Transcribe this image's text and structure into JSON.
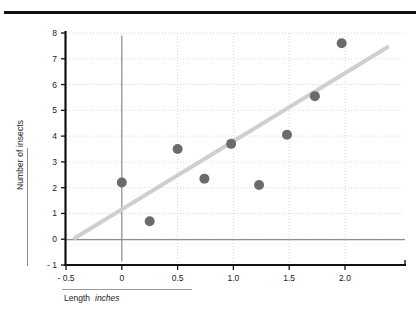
{
  "page": {
    "background": "#ffffff",
    "top_rule_color": "#111111"
  },
  "axis_titles": {
    "y": "Number of insects",
    "x_name": "Length",
    "x_unit": "inches"
  },
  "chart_data": {
    "type": "scatter",
    "title": "",
    "xlabel": "Length  inches",
    "ylabel": "Number of insects",
    "xlim": [
      -0.5,
      2.4
    ],
    "ylim": [
      -1,
      8
    ],
    "xticks": [
      -0.5,
      0,
      0.5,
      1.0,
      1.5,
      2.0
    ],
    "xticklabels": [
      "- 0.5",
      "0",
      "0.5",
      "1.0",
      "1.5",
      "2.0"
    ],
    "yticks": [
      -1,
      0,
      1,
      2,
      3,
      4,
      5,
      6,
      7,
      8
    ],
    "yticklabels": [
      "- 1",
      "0",
      "1",
      "2",
      "3",
      "4",
      "5",
      "6",
      "7",
      "8"
    ],
    "grid": true,
    "grid_style": "dotted",
    "grid_color": "#d8d8d8",
    "legend": null,
    "marker_color": "#6b6b6b",
    "marker_size": 5,
    "points": [
      {
        "x": 0.0,
        "y": 2.2
      },
      {
        "x": 0.25,
        "y": 0.7
      },
      {
        "x": 0.5,
        "y": 3.5
      },
      {
        "x": 0.74,
        "y": 2.35
      },
      {
        "x": 0.98,
        "y": 3.7
      },
      {
        "x": 1.23,
        "y": 2.1
      },
      {
        "x": 1.48,
        "y": 4.05
      },
      {
        "x": 1.73,
        "y": 5.55
      },
      {
        "x": 1.97,
        "y": 7.6
      }
    ],
    "series": [
      {
        "name": "insect counts",
        "x": [
          0.0,
          0.25,
          0.5,
          0.74,
          0.98,
          1.23,
          1.48,
          1.73,
          1.97
        ],
        "values": [
          2.2,
          0.7,
          3.5,
          2.35,
          3.7,
          2.1,
          4.05,
          5.55,
          7.6
        ]
      }
    ],
    "trend_line": {
      "color": "#cfcfcf",
      "width": 4,
      "x_start": -0.42,
      "y_start": 0.05,
      "x_end": 2.38,
      "y_end": 7.45
    },
    "zero_line": {
      "color": "#8d8d8d",
      "y": 0
    },
    "vertical_zero_line": {
      "color": "#8d8d8d",
      "x": 0,
      "y_top": 7.9,
      "y_bottom": -0.85
    }
  }
}
